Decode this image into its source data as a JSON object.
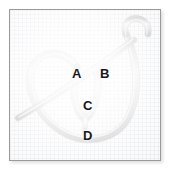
{
  "figure": {
    "background": "#fdfdfd",
    "grid_color": "#e1e4e8",
    "border_color": "#9a9a9a",
    "rope_color": "#d6d6d6",
    "rope_shade_color": "#b4b4b4",
    "rope_highlight_color": "#f2f2f2",
    "label_color": "#17171a"
  },
  "labels": [
    {
      "id": "A",
      "text": "A",
      "x": 72,
      "y": 65
    },
    {
      "id": "B",
      "text": "B",
      "x": 99,
      "y": 65
    },
    {
      "id": "C",
      "text": "C",
      "x": 82,
      "y": 97
    },
    {
      "id": "D",
      "text": "D",
      "x": 82,
      "y": 127
    }
  ]
}
